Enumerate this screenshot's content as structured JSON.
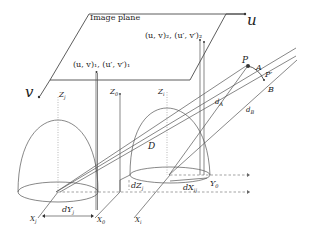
{
  "diagram": {
    "labels": {
      "image_plane": "Image plane",
      "u_axis": "u",
      "v_axis": "v",
      "point1": "(u, v)₁, (u′, v′)₁",
      "point2": "(u, v)₂, (u′, v′)₂",
      "P": "P",
      "A": "A",
      "P_prime": "P′",
      "B": "B",
      "dA": "d",
      "dA_sub": "A",
      "dB": "d",
      "dB_sub": "B",
      "D": "D",
      "Zj": "Z",
      "Zj_sub": "j",
      "Z0": "Z",
      "Z0_sub": "0",
      "Zi": "Z",
      "Zi_sub": "i",
      "dZj": "dZ",
      "dZj_sub": "j",
      "dYj": "dY",
      "dYj_sub": "j",
      "dXij": "dX",
      "dXij_sub": "ij",
      "Xj": "X",
      "Xj_sub": "j",
      "X0": "X",
      "X0_sub": "0",
      "Xi": "X",
      "Xi_sub": "i",
      "Y0": "Y",
      "Y0_sub": "0"
    }
  }
}
